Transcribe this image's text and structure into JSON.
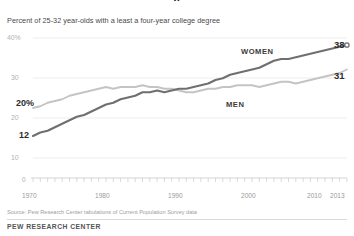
{
  "header": {
    "cut_title": "a",
    "subtitle": "Percent of 25-32 year-olds with a least a four-year college degree"
  },
  "axes": {
    "y_ticks": [
      "40%",
      "30",
      "20",
      "10"
    ],
    "y_tick_values": [
      40,
      30,
      20,
      10
    ],
    "zero_label": "0",
    "x_ticks": [
      "1970",
      "1980",
      "1990",
      "2000",
      "2010",
      "2013"
    ],
    "x_tick_values": [
      1970,
      1980,
      1990,
      2000,
      2010,
      2013
    ]
  },
  "annotations": {
    "women_label": "WOMEN",
    "men_label": "MEN",
    "women_end_value": "38",
    "men_end_value": "31",
    "men_start_value": "20%",
    "women_start_value": "12"
  },
  "footer": {
    "source": "Source: Pew Research Center tabulations of Current Population Survey data",
    "brand": "PEW RESEARCH CENTER"
  },
  "colors": {
    "women_line": "#6f6f6f",
    "men_line": "#c4c4c4",
    "grid": "#e6e6e6",
    "axis_text": "#a8a8a8",
    "body_text": "#4a4a4a"
  },
  "chart_data": {
    "type": "line",
    "title": "Percent of 25-32 year-olds with a least a four-year college degree",
    "xlabel": "",
    "ylabel": "",
    "xlim": [
      1970,
      2013
    ],
    "ylim": [
      0,
      40
    ],
    "grid": true,
    "legend": "inline-labels",
    "x": [
      1970,
      1971,
      1972,
      1973,
      1974,
      1975,
      1976,
      1977,
      1978,
      1979,
      1980,
      1981,
      1982,
      1983,
      1984,
      1985,
      1986,
      1987,
      1988,
      1989,
      1990,
      1991,
      1992,
      1993,
      1994,
      1995,
      1996,
      1997,
      1998,
      1999,
      2000,
      2001,
      2002,
      2003,
      2004,
      2005,
      2006,
      2007,
      2008,
      2009,
      2010,
      2011,
      2012,
      2013
    ],
    "series": [
      {
        "name": "WOMEN",
        "color": "#6f6f6f",
        "start_value": 12,
        "end_value": 38,
        "values": [
          12,
          13,
          13.5,
          14.5,
          15.5,
          16.5,
          17.5,
          18,
          19,
          20,
          21,
          21.5,
          22.5,
          23,
          23.5,
          24.5,
          24.5,
          25,
          24.5,
          25,
          25.5,
          25.5,
          26,
          26.5,
          27,
          28,
          28.5,
          29.5,
          30,
          30.5,
          31,
          31.5,
          32.5,
          33.5,
          34,
          34,
          34.5,
          35,
          35.5,
          36,
          36.5,
          37,
          37.5,
          38
        ]
      },
      {
        "name": "MEN",
        "color": "#c4c4c4",
        "start_value": 20,
        "end_value": 31,
        "values": [
          20,
          20.5,
          21.5,
          22,
          22.5,
          23.5,
          24,
          24.5,
          25,
          25.5,
          26,
          25.5,
          26,
          26,
          26,
          26.5,
          26,
          26,
          25.5,
          25.5,
          25,
          24.5,
          24.5,
          25,
          25.5,
          25.5,
          26,
          26,
          26.5,
          26.5,
          26.5,
          26,
          26.5,
          27,
          27.5,
          27.5,
          27,
          27.5,
          28,
          28.5,
          29,
          29.5,
          30,
          31
        ]
      }
    ]
  }
}
